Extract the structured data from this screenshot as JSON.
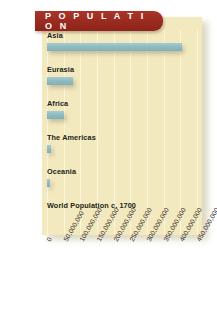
{
  "banner": {
    "title": "P O P U L A T I O N",
    "plain_title": "POPULATION",
    "color": "#9e2d22"
  },
  "colors": {
    "banner": "#9e2d22",
    "panel": "#f3e9bf",
    "bar": "#8fbdc4",
    "gridline": "#fdf6dc",
    "text": "#231f16"
  },
  "chart_data": {
    "type": "bar",
    "orientation": "horizontal",
    "title": "POPULATION",
    "xlabel": "",
    "ylabel": "",
    "grid": true,
    "legend": false,
    "xlim": [
      0,
      450000000
    ],
    "categories": [
      "Asia",
      "Eurasia",
      "Africa",
      "The Americas",
      "Oceania",
      "World Population c. 1700"
    ],
    "values": [
      405000000,
      77000000,
      52000000,
      13000000,
      10000000,
      0
    ],
    "tick_labels": [
      "0",
      "50,000,000",
      "100,000,000",
      "150,000,000",
      "200,000,000",
      "250,000,000",
      "300,000,000",
      "350,000,000",
      "400,000,000",
      "450,000,000"
    ],
    "tick_values": [
      0,
      50000000,
      100000000,
      150000000,
      200000000,
      250000000,
      300000000,
      350000000,
      400000000,
      450000000
    ]
  }
}
